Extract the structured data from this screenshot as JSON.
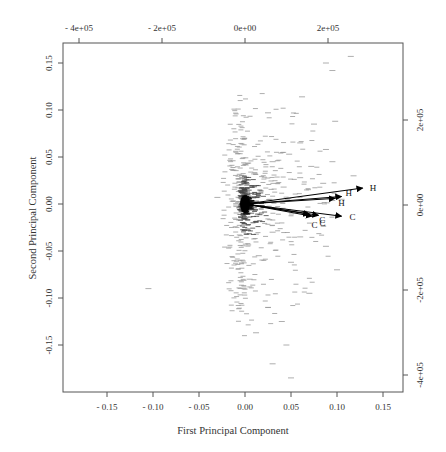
{
  "chart_data": {
    "type": "scatter",
    "subtype": "pca-biplot",
    "title": "",
    "xlabel": "First Principal Component",
    "ylabel": "Second Principal Component",
    "xlim": [
      -0.19,
      0.17
    ],
    "ylim": [
      -0.2,
      0.17
    ],
    "grid": false,
    "legend": null,
    "axes": {
      "bottom": {
        "ticks": [
          -0.15,
          -0.1,
          -0.05,
          0.0,
          0.05,
          0.1,
          0.15
        ],
        "labels": [
          "- 0.15",
          "- 0.10",
          "- 0.05",
          "0.00",
          "0.05",
          "0.10",
          "0.15"
        ]
      },
      "left": {
        "ticks": [
          0.15,
          0.1,
          0.05,
          0.0,
          -0.05,
          -0.1,
          -0.15
        ],
        "labels": [
          "0.15",
          "0.10",
          "0.05",
          "0.00",
          "-0.05",
          "-0.10",
          "-0.15"
        ]
      },
      "top": {
        "ticks": [
          -400000,
          -200000,
          0,
          200000
        ],
        "labels": [
          "- 4e+05",
          "- 2e+05",
          "0e+00",
          "2e+05"
        ]
      },
      "right": {
        "ticks": [
          200000,
          0,
          -200000,
          -400000
        ],
        "labels": [
          "2e+05",
          "0e+00",
          "-2e+05",
          "-4e+05"
        ]
      }
    },
    "loadings": [
      {
        "label": "H",
        "x": 0.128,
        "y": 0.017
      },
      {
        "label": "H",
        "x": 0.105,
        "y": 0.008
      },
      {
        "label": "H",
        "x": 0.098,
        "y": 0.006
      },
      {
        "label": "C",
        "x": 0.105,
        "y": -0.013
      },
      {
        "label": "C",
        "x": 0.08,
        "y": -0.012
      },
      {
        "label": "C",
        "x": 0.073,
        "y": -0.013
      },
      {
        "label": "C",
        "x": 0.07,
        "y": -0.011
      }
    ],
    "scores_description": "Several thousand observations drawn as short horizontal dashes; dense cluster at origin (~0,0), spreading mainly to positive PC1 and along PC2 from about -0.19 to 0.16",
    "scores_sample": [
      [
        0.115,
        0.157
      ],
      [
        0.088,
        0.15
      ],
      [
        0.095,
        0.142
      ],
      [
        0.062,
        0.114
      ],
      [
        0.025,
        0.097
      ],
      [
        0.075,
        0.085
      ],
      [
        0.098,
        0.088
      ],
      [
        0.06,
        0.065
      ],
      [
        0.088,
        0.058
      ],
      [
        0.048,
        0.053
      ],
      [
        0.03,
        0.045
      ],
      [
        0.095,
        0.045
      ],
      [
        0.072,
        0.04
      ],
      [
        0.01,
        0.032
      ],
      [
        0.06,
        0.028
      ],
      [
        0.118,
        0.03
      ],
      [
        0.042,
        0.018
      ],
      [
        0.085,
        0.022
      ],
      [
        -0.03,
        0.007
      ],
      [
        0.105,
        0.005
      ],
      [
        0.03,
        -0.03
      ],
      [
        0.06,
        -0.035
      ],
      [
        0.088,
        -0.045
      ],
      [
        0.015,
        -0.055
      ],
      [
        0.05,
        -0.062
      ],
      [
        0.1,
        -0.07
      ],
      [
        0.005,
        -0.08
      ],
      [
        0.07,
        -0.095
      ],
      [
        0.025,
        -0.11
      ],
      [
        0.04,
        -0.125
      ],
      [
        0.012,
        -0.137
      ],
      [
        0.045,
        -0.15
      ],
      [
        0.03,
        -0.17
      ],
      [
        0.05,
        -0.185
      ],
      [
        -0.105,
        -0.09
      ]
    ]
  }
}
